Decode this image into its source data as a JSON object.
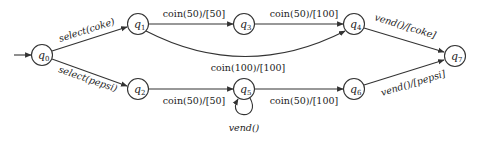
{
  "diagram": {
    "type": "state-machine",
    "title": "",
    "start_state": "q0",
    "states": [
      {
        "id": "q0",
        "base": "q",
        "sub": "0",
        "x": 42,
        "y": 55
      },
      {
        "id": "q1",
        "base": "q",
        "sub": "1",
        "x": 138,
        "y": 24
      },
      {
        "id": "q2",
        "base": "q",
        "sub": "2",
        "x": 138,
        "y": 89
      },
      {
        "id": "q3",
        "base": "q",
        "sub": "3",
        "x": 244,
        "y": 24
      },
      {
        "id": "q4",
        "base": "q",
        "sub": "4",
        "x": 354,
        "y": 24
      },
      {
        "id": "q5",
        "base": "q",
        "sub": "5",
        "x": 244,
        "y": 89
      },
      {
        "id": "q6",
        "base": "q",
        "sub": "6",
        "x": 354,
        "y": 89
      },
      {
        "id": "q7",
        "base": "q",
        "sub": "7",
        "x": 455,
        "y": 56
      }
    ],
    "transitions": [
      {
        "from": "q0",
        "to": "q1",
        "label": "select(coke)"
      },
      {
        "from": "q0",
        "to": "q2",
        "label": "select(pepsi)"
      },
      {
        "from": "q1",
        "to": "q3",
        "label": "coin(50)/[50]"
      },
      {
        "from": "q3",
        "to": "q4",
        "label": "coin(50)/[100]"
      },
      {
        "from": "q1",
        "to": "q4",
        "label": "coin(100)/[100]"
      },
      {
        "from": "q2",
        "to": "q5",
        "label": "coin(50)/[50]"
      },
      {
        "from": "q5",
        "to": "q5",
        "label": "vend()"
      },
      {
        "from": "q5",
        "to": "q6",
        "label": "coin(50)/[100]"
      },
      {
        "from": "q4",
        "to": "q7",
        "label": "vend()/[coke]"
      },
      {
        "from": "q6",
        "to": "q7",
        "label": "vend()/[pepsi]"
      }
    ]
  }
}
